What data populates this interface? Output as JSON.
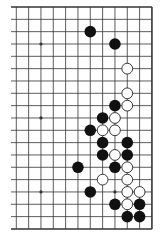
{
  "diagram": {
    "type": "go-board-partial",
    "board_size": 19,
    "visible_columns": [
      7,
      18
    ],
    "visible_rows": [
      0,
      18
    ],
    "colors": {
      "background": "#ffffff",
      "line": "#333333",
      "black_stone": "#111111",
      "white_stone_fill": "#ffffff",
      "white_stone_stroke": "#222222"
    },
    "hoshi": [
      {
        "col": 9,
        "row": 3
      },
      {
        "col": 9,
        "row": 9
      },
      {
        "col": 9,
        "row": 15
      },
      {
        "col": 15,
        "row": 15
      }
    ],
    "stones": [
      {
        "color": "black",
        "col": 13,
        "row": 2
      },
      {
        "color": "black",
        "col": 15,
        "row": 3
      },
      {
        "color": "white",
        "col": 16,
        "row": 5
      },
      {
        "color": "white",
        "col": 16,
        "row": 7
      },
      {
        "color": "black",
        "col": 15,
        "row": 8
      },
      {
        "color": "white",
        "col": 16,
        "row": 8
      },
      {
        "color": "black",
        "col": 14,
        "row": 9
      },
      {
        "color": "white",
        "col": 15,
        "row": 9
      },
      {
        "color": "black",
        "col": 13,
        "row": 10
      },
      {
        "color": "white",
        "col": 14,
        "row": 10
      },
      {
        "color": "white",
        "col": 15,
        "row": 10
      },
      {
        "color": "black",
        "col": 14,
        "row": 11
      },
      {
        "color": "black",
        "col": 16,
        "row": 11
      },
      {
        "color": "black",
        "col": 14,
        "row": 12
      },
      {
        "color": "white",
        "col": 15,
        "row": 12
      },
      {
        "color": "black",
        "col": 16,
        "row": 12
      },
      {
        "color": "black",
        "col": 12,
        "row": 13
      },
      {
        "color": "black",
        "col": 15,
        "row": 13
      },
      {
        "color": "white",
        "col": 16,
        "row": 13
      },
      {
        "color": "white",
        "col": 14,
        "row": 14
      },
      {
        "color": "white",
        "col": 16,
        "row": 14
      },
      {
        "color": "black",
        "col": 13,
        "row": 15
      },
      {
        "color": "white",
        "col": 16,
        "row": 15
      },
      {
        "color": "white",
        "col": 17,
        "row": 15
      },
      {
        "color": "black",
        "col": 15,
        "row": 16
      },
      {
        "color": "white",
        "col": 16,
        "row": 16
      },
      {
        "color": "black",
        "col": 17,
        "row": 16
      },
      {
        "color": "black",
        "col": 16,
        "row": 17
      },
      {
        "color": "black",
        "col": 17,
        "row": 17
      }
    ]
  }
}
